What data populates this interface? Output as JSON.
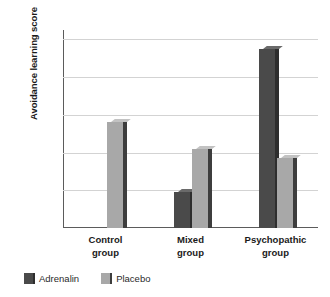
{
  "chart_data": {
    "type": "bar",
    "title": "",
    "subtitle": "",
    "xlabel": "",
    "ylabel": "Avoidance learning score",
    "categories": [
      "Control group",
      "Mixed group",
      "Psychopathic group"
    ],
    "category_lines": [
      [
        "Control",
        "group"
      ],
      [
        "Mixed",
        "group"
      ],
      [
        "Psychopathic",
        "group"
      ]
    ],
    "series": [
      {
        "name": "Adrenalin",
        "color": "#4a4a4a",
        "values": [
          null,
          0.019,
          0.095
        ]
      },
      {
        "name": "Placebo",
        "color": "#a8a8a8",
        "values": [
          0.056,
          0.042,
          0.037
        ]
      }
    ],
    "ylim": [
      0.0,
      0.105
    ],
    "yticks": [
      0.0,
      0.02,
      0.04,
      0.06,
      0.08,
      0.1
    ],
    "ytick_labels": [
      ".00",
      ".02",
      ".04",
      ".06",
      ".08",
      ".10"
    ],
    "grid": true,
    "grid_axis": "y",
    "legend_position": "bottom-left"
  },
  "legend": {
    "items": [
      {
        "label": "Adrenalin",
        "color": "#4a4a4a"
      },
      {
        "label": "Placebo",
        "color": "#a8a8a8"
      }
    ]
  },
  "colors": {
    "adrenalin": "#4a4a4a",
    "placebo": "#a8a8a8",
    "adrenalin_side": "#2e2e2e",
    "placebo_side": "#3d3d3d",
    "gridline": "#d3d3d3",
    "axis": "#5b5b5b",
    "text": "#1a1a1a",
    "background": "#ffffff"
  }
}
